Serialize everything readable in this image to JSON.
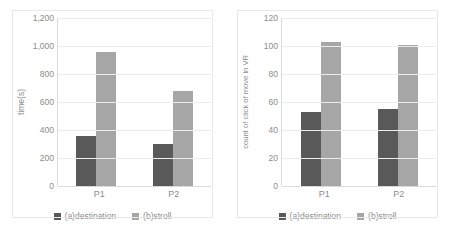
{
  "figure": {
    "background": "#ffffff",
    "panel_border_color": "#e8e8e8"
  },
  "colors": {
    "destination": "#595959",
    "stroll": "#a6a6a6",
    "gridline": "#ededed",
    "axis": "#d9d9d9",
    "text": "#8c8c8c"
  },
  "chart_data": [
    {
      "type": "bar",
      "title": "",
      "xlabel": "",
      "ylabel": "time(s)",
      "categories": [
        "P1",
        "P2"
      ],
      "series": [
        {
          "name": "(a)destination",
          "values": [
            360,
            300
          ],
          "color": "#595959"
        },
        {
          "name": "(b)stroll",
          "values": [
            960,
            680
          ],
          "color": "#a6a6a6"
        }
      ],
      "ylim": [
        0,
        1200
      ],
      "yticks": [
        0,
        200,
        400,
        600,
        800,
        1000,
        1200
      ],
      "ytick_labels": [
        "0",
        "200",
        "400",
        "600",
        "800",
        "1,000",
        "1,200"
      ],
      "grid": true,
      "legend_position": "bottom"
    },
    {
      "type": "bar",
      "title": "",
      "xlabel": "",
      "ylabel": "count of click of move in VR",
      "categories": [
        "P1",
        "P2"
      ],
      "series": [
        {
          "name": "(a)destination",
          "values": [
            53,
            55
          ],
          "color": "#595959"
        },
        {
          "name": "(b)stroll",
          "values": [
            103,
            101
          ],
          "color": "#a6a6a6"
        }
      ],
      "ylim": [
        0,
        120
      ],
      "yticks": [
        0,
        20,
        40,
        60,
        80,
        100,
        120
      ],
      "ytick_labels": [
        "0",
        "20",
        "40",
        "60",
        "80",
        "100",
        "120"
      ],
      "grid": true,
      "legend_position": "bottom"
    }
  ]
}
